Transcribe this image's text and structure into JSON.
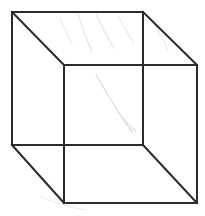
{
  "figure": {
    "canvas": {
      "width": 205,
      "height": 216
    },
    "background_color": "#ffffff",
    "line_color": "#2b2b2b",
    "line_width": 2,
    "smudge_color": "#e2e0e0",
    "smudge_width": 1
  },
  "geometry": {
    "vertices": {
      "back_top_left": {
        "x": 12,
        "y": 12
      },
      "back_top_right": {
        "x": 143,
        "y": 12
      },
      "back_bottom_right": {
        "x": 143,
        "y": 145
      },
      "back_bottom_left": {
        "x": 12,
        "y": 145
      },
      "front_top_left": {
        "x": 64,
        "y": 65
      },
      "front_top_right": {
        "x": 197,
        "y": 65
      },
      "front_bottom_right": {
        "x": 197,
        "y": 203
      },
      "front_bottom_left": {
        "x": 64,
        "y": 203
      }
    },
    "back_face_points": "12,12 143,12 143,145 12,145",
    "front_face_points": "64,65 197,65 197,203 64,203",
    "connectors": [
      {
        "name": "top-left-connector",
        "x1": 12,
        "y1": 12,
        "x2": 64,
        "y2": 65
      },
      {
        "name": "top-right-connector",
        "x1": 143,
        "y1": 12,
        "x2": 197,
        "y2": 65
      },
      {
        "name": "bottom-right-connector",
        "x1": 143,
        "y1": 145,
        "x2": 197,
        "y2": 203
      },
      {
        "name": "bottom-left-connector",
        "x1": 12,
        "y1": 145,
        "x2": 64,
        "y2": 203
      }
    ]
  },
  "artifacts": {
    "smudge_paths": [
      "M 78 14 Q 84 34 92 52",
      "M 96 14 Q 104 32 114 48",
      "M 118 16 Q 126 30 134 44",
      "M 60 18 Q 66 32 72 44",
      "M 152 18 Q 160 34 168 50",
      "M 96 74 Q 112 104 132 132",
      "M 118 112 Q 126 122 136 132",
      "M 40 196 Q 60 206 86 210"
    ]
  }
}
